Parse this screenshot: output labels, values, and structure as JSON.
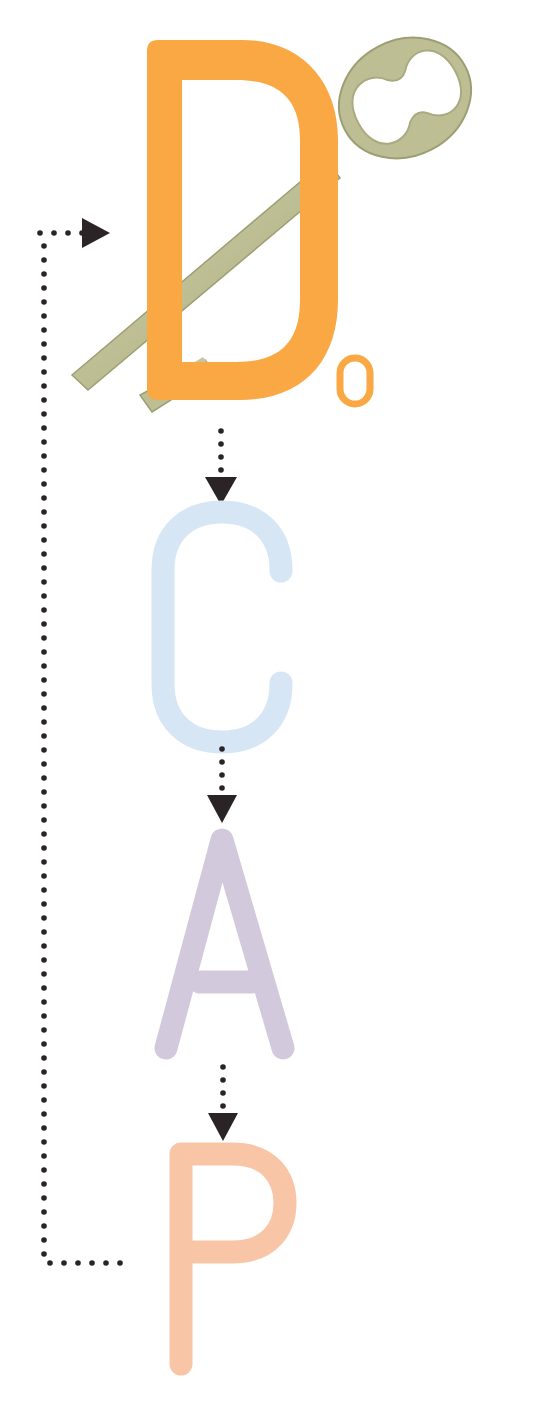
{
  "diagram": {
    "type": "cycle-flow",
    "steps": [
      {
        "id": "d0",
        "letter": "D",
        "subscript": "0",
        "color": "#F9A843",
        "note": "with key illustration"
      },
      {
        "id": "c",
        "letter": "C",
        "color": "#D6E6F5"
      },
      {
        "id": "a",
        "letter": "A",
        "color": "#D3C9DC"
      },
      {
        "id": "p",
        "letter": "P",
        "color": "#F8C6A7"
      }
    ],
    "flow": [
      "D0 → C",
      "C → A",
      "A → P",
      "P → D0 (loop back)"
    ],
    "colors": {
      "arrow": "#2A2426",
      "key": "#BFBF96",
      "key_shadow": "#9D9E74",
      "background": "#FFFFFF"
    }
  }
}
